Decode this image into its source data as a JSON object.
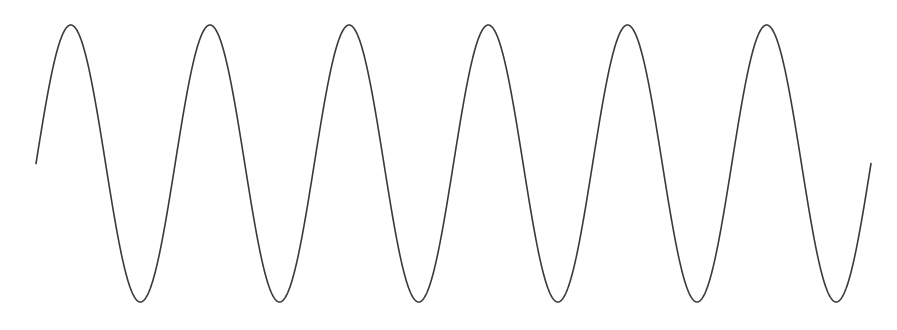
{
  "figure": {
    "type": "sine-wave",
    "stroke_color": "#3a3a3a",
    "background_color": "#ffffff",
    "stroke_width": 1.6,
    "x_start": 36,
    "x_end": 871,
    "midline_y": 163.5,
    "amplitude": 138.5,
    "periods": 6,
    "phase": "starts at midline rising"
  }
}
